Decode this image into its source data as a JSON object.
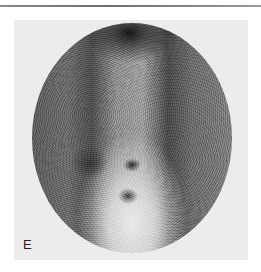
{
  "figure": {
    "panel_label": "E",
    "image_type": "grayscale scintigraphy scan",
    "colors": {
      "background": "#ffffff",
      "panel_background": "#ececec",
      "rule": "#7a7a7a",
      "label": "#222222"
    }
  }
}
